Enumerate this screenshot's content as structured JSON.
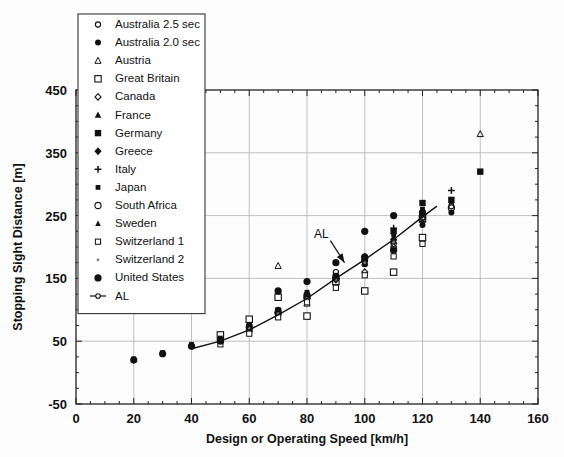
{
  "chart_data": {
    "type": "scatter",
    "title": "",
    "xlabel": "Design or Operating Speed [km/h]",
    "ylabel": "Stopping Sight Distance [m]",
    "xlim": [
      0,
      160
    ],
    "ylim": [
      -50,
      450
    ],
    "xticks": [
      0,
      20,
      40,
      60,
      80,
      100,
      120,
      140,
      160
    ],
    "yticks": [
      -50,
      50,
      150,
      250,
      350,
      450
    ],
    "xtick_labels": [
      "0",
      "20",
      "40",
      "60",
      "80",
      "100",
      "120",
      "140",
      "160"
    ],
    "ytick_labels": [
      "-50",
      "50",
      "150",
      "250",
      "350",
      "450"
    ],
    "minor_tick_step_x": 5,
    "minor_tick_step_y": 25,
    "grid": true,
    "grid_color": "#b8b8b8",
    "legend_position": "upper-left-inside",
    "annotations": [
      {
        "text": "AL",
        "x": 85,
        "y": 215,
        "arrow_to_x": 93,
        "arrow_to_y": 175
      }
    ],
    "series": [
      {
        "name": "Australia  2.5 sec",
        "marker": "open-circle-small",
        "points": [
          [
            50,
            55
          ],
          [
            60,
            75
          ],
          [
            70,
            100
          ],
          [
            80,
            125
          ],
          [
            90,
            160
          ],
          [
            100,
            185
          ],
          [
            110,
            205
          ],
          [
            120,
            250
          ],
          [
            130,
            265
          ]
        ]
      },
      {
        "name": "Australia 2.0 sec",
        "marker": "filled-circle",
        "points": [
          [
            50,
            50
          ],
          [
            60,
            70
          ],
          [
            70,
            90
          ],
          [
            80,
            115
          ],
          [
            90,
            145
          ],
          [
            100,
            175
          ],
          [
            110,
            195
          ],
          [
            120,
            235
          ],
          [
            130,
            255
          ]
        ]
      },
      {
        "name": "Austria",
        "marker": "open-triangle-small",
        "points": [
          [
            70,
            170
          ],
          [
            80,
            110
          ],
          [
            90,
            145
          ],
          [
            100,
            175
          ],
          [
            110,
            210
          ],
          [
            120,
            250
          ],
          [
            140,
            380
          ]
        ]
      },
      {
        "name": "Great Britain",
        "marker": "open-square",
        "points": [
          [
            50,
            60
          ],
          [
            60,
            85
          ],
          [
            70,
            120
          ],
          [
            80,
            90
          ],
          [
            90,
            145
          ],
          [
            100,
            130
          ],
          [
            110,
            160
          ],
          [
            120,
            215
          ],
          [
            120,
            245
          ]
        ]
      },
      {
        "name": "Canada",
        "marker": "open-diamond-small",
        "points": [
          [
            50,
            48
          ],
          [
            60,
            65
          ],
          [
            70,
            95
          ],
          [
            80,
            120
          ],
          [
            90,
            150
          ],
          [
            100,
            160
          ],
          [
            110,
            200
          ],
          [
            120,
            245
          ]
        ]
      },
      {
        "name": "France",
        "marker": "filled-triangle",
        "points": [
          [
            60,
            70
          ],
          [
            70,
            95
          ],
          [
            80,
            120
          ],
          [
            90,
            150
          ],
          [
            100,
            180
          ],
          [
            110,
            215
          ],
          [
            120,
            255
          ]
        ]
      },
      {
        "name": "Germany",
        "marker": "filled-square",
        "points": [
          [
            60,
            72
          ],
          [
            70,
            98
          ],
          [
            80,
            122
          ],
          [
            90,
            152
          ],
          [
            100,
            182
          ],
          [
            110,
            225
          ],
          [
            120,
            270
          ],
          [
            130,
            275
          ],
          [
            140,
            320
          ]
        ]
      },
      {
        "name": "Greece",
        "marker": "filled-diamond",
        "points": [
          [
            60,
            68
          ],
          [
            70,
            92
          ],
          [
            80,
            118
          ],
          [
            90,
            148
          ],
          [
            100,
            178
          ],
          [
            110,
            212
          ],
          [
            120,
            252
          ]
        ]
      },
      {
        "name": "Italy",
        "marker": "plus",
        "points": [
          [
            70,
            95
          ],
          [
            80,
            118
          ],
          [
            90,
            150
          ],
          [
            100,
            185
          ],
          [
            110,
            230
          ],
          [
            120,
            240
          ],
          [
            130,
            290
          ]
        ]
      },
      {
        "name": "Japan",
        "marker": "filled-square-small",
        "points": [
          [
            20,
            22
          ],
          [
            30,
            32
          ],
          [
            40,
            45
          ],
          [
            50,
            55
          ],
          [
            60,
            75
          ],
          [
            70,
            100
          ],
          [
            80,
            128
          ],
          [
            90,
            155
          ],
          [
            100,
            185
          ],
          [
            110,
            220
          ],
          [
            120,
            260
          ],
          [
            130,
            272
          ]
        ]
      },
      {
        "name": "South Africa",
        "marker": "open-circle",
        "points": [
          [
            50,
            52
          ],
          [
            60,
            72
          ],
          [
            70,
            96
          ],
          [
            80,
            122
          ],
          [
            90,
            152
          ],
          [
            100,
            182
          ],
          [
            110,
            195
          ],
          [
            120,
            248
          ],
          [
            130,
            262
          ]
        ]
      },
      {
        "name": "Sweden",
        "marker": "filled-triangle-small",
        "points": [
          [
            70,
            98
          ],
          [
            80,
            124
          ],
          [
            90,
            154
          ],
          [
            100,
            172
          ],
          [
            110,
            214
          ],
          [
            120,
            252
          ]
        ]
      },
      {
        "name": "Switzerland 1",
        "marker": "open-square-small",
        "points": [
          [
            50,
            45
          ],
          [
            60,
            62
          ],
          [
            70,
            88
          ],
          [
            80,
            112
          ],
          [
            90,
            135
          ],
          [
            100,
            155
          ],
          [
            110,
            185
          ],
          [
            120,
            205
          ]
        ]
      },
      {
        "name": "Switzerland 2",
        "marker": "dot-small",
        "points": [
          [
            60,
            70
          ],
          [
            70,
            94
          ],
          [
            80,
            118
          ],
          [
            90,
            148
          ],
          [
            100,
            175
          ],
          [
            110,
            208
          ]
        ]
      },
      {
        "name": "United States",
        "marker": "filled-circle-large",
        "points": [
          [
            20,
            20
          ],
          [
            30,
            30
          ],
          [
            40,
            42
          ],
          [
            50,
            50
          ],
          [
            70,
            130
          ],
          [
            80,
            145
          ],
          [
            90,
            175
          ],
          [
            100,
            225
          ],
          [
            110,
            250
          ],
          [
            120,
            255
          ]
        ]
      },
      {
        "name": "AL",
        "marker": "line-with-circle",
        "is_line": true,
        "points": [
          [
            40,
            38
          ],
          [
            50,
            50
          ],
          [
            60,
            68
          ],
          [
            70,
            92
          ],
          [
            80,
            118
          ],
          [
            90,
            150
          ],
          [
            100,
            180
          ],
          [
            110,
            212
          ],
          [
            120,
            248
          ],
          [
            125,
            265
          ]
        ]
      }
    ]
  },
  "legend": {
    "items": [
      {
        "label": "Australia  2.5 sec",
        "marker": "open-circle-small"
      },
      {
        "label": "Australia 2.0 sec",
        "marker": "filled-circle"
      },
      {
        "label": "Austria",
        "marker": "open-triangle-small"
      },
      {
        "label": "Great Britain",
        "marker": "open-square"
      },
      {
        "label": "Canada",
        "marker": "open-diamond-small"
      },
      {
        "label": "France",
        "marker": "filled-triangle"
      },
      {
        "label": "Germany",
        "marker": "filled-square"
      },
      {
        "label": "Greece",
        "marker": "filled-diamond"
      },
      {
        "label": "Italy",
        "marker": "plus"
      },
      {
        "label": "Japan",
        "marker": "filled-square-small"
      },
      {
        "label": "South Africa",
        "marker": "open-circle"
      },
      {
        "label": "Sweden",
        "marker": "filled-triangle-small"
      },
      {
        "label": "Switzerland 1",
        "marker": "open-square-small"
      },
      {
        "label": "Switzerland 2",
        "marker": "dot-small"
      },
      {
        "label": "United States",
        "marker": "filled-circle-large"
      },
      {
        "label": "AL",
        "marker": "line-with-circle"
      }
    ]
  },
  "colors": {
    "ink": "#111111",
    "grid": "#b8b8b8",
    "axis": "#222222",
    "background": "#fdfdfd"
  }
}
